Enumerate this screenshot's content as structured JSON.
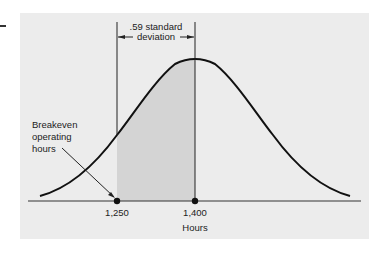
{
  "figure": {
    "annotation_top_line1": ".59 standard",
    "annotation_top_line2": "deviation",
    "left_label_line1": "Breakeven",
    "left_label_line2": "operating",
    "left_label_line3": "hours",
    "tick_left": "1,250",
    "tick_mean": "1,400",
    "x_axis_label": "Hours"
  },
  "colors": {
    "panel_background": "#ececec",
    "shaded_region": "#d4d4d4",
    "curve": "#111111"
  }
}
